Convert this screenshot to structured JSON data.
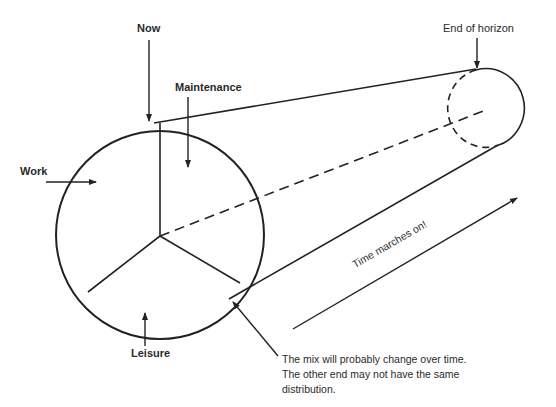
{
  "diagram": {
    "labels": {
      "now": "Now",
      "maintenance": "Maintenance",
      "work": "Work",
      "leisure": "Leisure",
      "end_of_horizon": "End of horizon",
      "time_arrow": "Time marches on!"
    },
    "note": {
      "line1": "The mix will probably change over time.",
      "line2": "The other end may not have the same",
      "line3": "distribution."
    },
    "pie_segments": [
      "Maintenance",
      "Work",
      "Leisure"
    ]
  }
}
